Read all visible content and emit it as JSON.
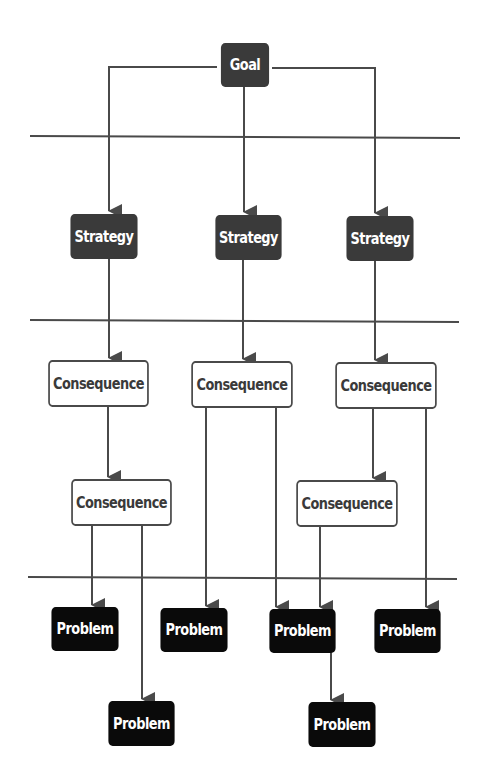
{
  "diagram": {
    "type": "hierarchy-flow",
    "colors": {
      "goal": "#3a3a3a",
      "strategy": "#3a3a3a",
      "consequence_fill": "#ffffff",
      "consequence_border": "#4a4a4a",
      "problem": "#0a0a0a",
      "line": "#555555"
    },
    "nodes": {
      "goal": {
        "label": "Goal"
      },
      "strategy_1": {
        "label": "Strategy"
      },
      "strategy_2": {
        "label": "Strategy"
      },
      "strategy_3": {
        "label": "Strategy"
      },
      "consequence_1a": {
        "label": "Consequence"
      },
      "consequence_2a": {
        "label": "Consequence"
      },
      "consequence_3a": {
        "label": "Consequence"
      },
      "consequence_1b": {
        "label": "Consequence"
      },
      "consequence_3b": {
        "label": "Consequence"
      },
      "problem_1": {
        "label": "Problem"
      },
      "problem_2": {
        "label": "Problem"
      },
      "problem_3": {
        "label": "Problem"
      },
      "problem_4": {
        "label": "Problem"
      },
      "problem_5": {
        "label": "Problem"
      },
      "problem_6": {
        "label": "Problem"
      }
    },
    "edges": [
      [
        "goal",
        "strategy_1"
      ],
      [
        "goal",
        "strategy_2"
      ],
      [
        "goal",
        "strategy_3"
      ],
      [
        "strategy_1",
        "consequence_1a"
      ],
      [
        "strategy_2",
        "consequence_2a"
      ],
      [
        "strategy_3",
        "consequence_3a"
      ],
      [
        "consequence_1a",
        "consequence_1b"
      ],
      [
        "consequence_3a",
        "consequence_3b"
      ],
      [
        "consequence_1b",
        "problem_1"
      ],
      [
        "consequence_1b",
        "problem_5"
      ],
      [
        "consequence_2a",
        "problem_2"
      ],
      [
        "consequence_2a",
        "problem_3"
      ],
      [
        "consequence_3b",
        "problem_3"
      ],
      [
        "problem_3",
        "problem_6"
      ],
      [
        "consequence_3a",
        "problem_4"
      ]
    ],
    "level_separators": 3
  }
}
